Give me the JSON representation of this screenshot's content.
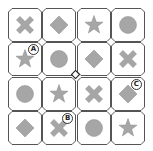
{
  "board": {
    "rows": 4,
    "cols": 4,
    "shape_color": "#a6a6a6",
    "border_color": "#555555",
    "cells": [
      [
        {
          "shape": "x"
        },
        {
          "shape": "diamond"
        },
        {
          "shape": "star"
        },
        {
          "shape": "circle"
        }
      ],
      [
        {
          "shape": "star",
          "badge": "A"
        },
        {
          "shape": "circle"
        },
        {
          "shape": "diamond"
        },
        {
          "shape": "x"
        }
      ],
      [
        {
          "shape": "circle"
        },
        {
          "shape": "star"
        },
        {
          "shape": "x"
        },
        {
          "shape": "diamond",
          "badge": "C"
        }
      ],
      [
        {
          "shape": "diamond"
        },
        {
          "shape": "x",
          "badge": "B"
        },
        {
          "shape": "circle"
        },
        {
          "shape": "star"
        }
      ]
    ]
  },
  "center_marker": {
    "shape": "diamond-outline"
  }
}
